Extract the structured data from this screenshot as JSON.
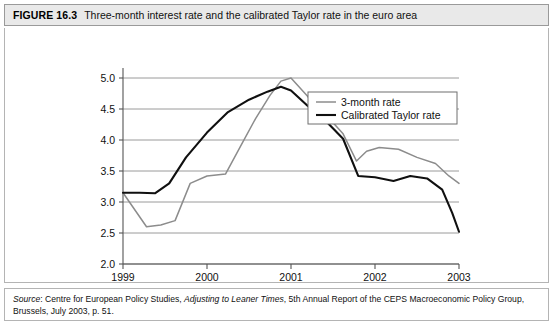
{
  "figure": {
    "number": "FIGURE 16.3",
    "title": "Three-month interest rate and the calibrated Taylor rate in the euro area"
  },
  "source": {
    "label": "Source",
    "colon": ": ",
    "part1": "Centre for European Policy Studies, ",
    "italic": "Adjusting to Leaner Times",
    "part2": ", 5th Annual Report of the CEPS Macroeconomic Policy Group, Brussels, July 2003, p. 51."
  },
  "colors": {
    "series_3month": "#8c8c8c",
    "series_taylor": "#101010",
    "gridline": "#8f8f8f",
    "axis": "#555555",
    "title_bar": "#e9e9e9",
    "panel_border": "#b4b4b4"
  },
  "chart_data": {
    "type": "line",
    "title": "Three-month interest rate and the calibrated Taylor rate in the euro area",
    "xlabel": "",
    "ylabel": "",
    "xlim": [
      1999,
      2003
    ],
    "ylim": [
      2.0,
      5.0
    ],
    "grid": true,
    "legend_position": "top-right",
    "xticks": [
      1999,
      2000,
      2001,
      2002,
      2003
    ],
    "xtick_labels": [
      "1999",
      "2000",
      "2001",
      "2002",
      "2003"
    ],
    "yticks": [
      2.0,
      2.5,
      3.0,
      3.5,
      4.0,
      4.5,
      5.0
    ],
    "ytick_labels": [
      "2.0",
      "2.5",
      "3.0",
      "3.5",
      "4.0",
      "4.5",
      "5.0"
    ],
    "series": [
      {
        "name": "3-month rate",
        "color": "#8c8c8c",
        "x": [
          1999.0,
          1999.28,
          1999.45,
          1999.62,
          1999.8,
          2000.0,
          2000.22,
          2000.4,
          2000.58,
          2000.75,
          2000.88,
          2001.0,
          2001.2,
          2001.42,
          2001.62,
          2001.78,
          2001.9,
          2002.05,
          2002.28,
          2002.5,
          2002.72,
          2002.88,
          2003.0
        ],
        "y": [
          3.15,
          2.6,
          2.63,
          2.7,
          3.3,
          3.42,
          3.45,
          3.9,
          4.35,
          4.72,
          4.95,
          5.0,
          4.7,
          4.4,
          4.1,
          3.66,
          3.82,
          3.88,
          3.85,
          3.72,
          3.62,
          3.42,
          3.3
        ]
      },
      {
        "name": "Calibrated Taylor rate",
        "color": "#101010",
        "x": [
          1999.0,
          1999.2,
          1999.38,
          1999.55,
          1999.75,
          2000.0,
          2000.25,
          2000.5,
          2000.72,
          2000.88,
          2001.0,
          2001.2,
          2001.42,
          2001.62,
          2001.8,
          2002.0,
          2002.22,
          2002.42,
          2002.62,
          2002.8,
          2002.92,
          2003.0
        ],
        "y": [
          3.15,
          3.15,
          3.14,
          3.3,
          3.72,
          4.12,
          4.45,
          4.65,
          4.78,
          4.86,
          4.8,
          4.55,
          4.3,
          4.02,
          3.42,
          3.4,
          3.34,
          3.42,
          3.38,
          3.2,
          2.82,
          2.52
        ]
      }
    ]
  }
}
